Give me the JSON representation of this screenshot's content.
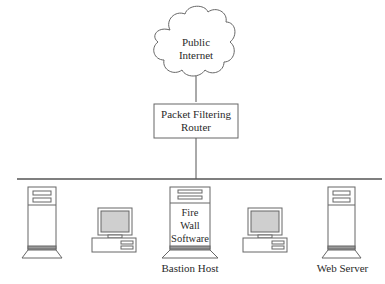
{
  "diagram": {
    "cloud": {
      "label_line1": "Public",
      "label_line2": "Internet"
    },
    "router": {
      "label_line1": "Packet Filtering",
      "label_line2": "Router"
    },
    "bastion": {
      "inner_line1": "Fire",
      "inner_line2": "Wall",
      "inner_line3": "Software",
      "caption": "Bastion Host"
    },
    "web_server": {
      "caption": "Web Server"
    },
    "colors": {
      "line": "#555555",
      "screen": "#cfcfcf",
      "stroke": "#666666"
    }
  }
}
